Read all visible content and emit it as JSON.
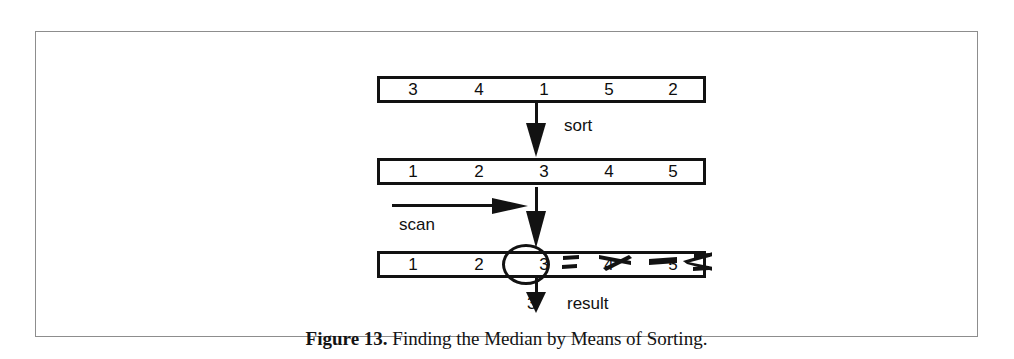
{
  "figure": {
    "caption_label": "Figure 13.",
    "caption_text": "Finding the Median by Means of Sorting."
  },
  "rows": {
    "unsorted": {
      "name": "unsorted-array",
      "values": [
        "3",
        "4",
        "1",
        "5",
        "2"
      ]
    },
    "sorted": {
      "name": "sorted-array",
      "values": [
        "1",
        "2",
        "3",
        "4",
        "5"
      ]
    },
    "scanned": {
      "name": "scanned-array",
      "values": [
        "1",
        "2",
        "3",
        "4",
        "5"
      ],
      "median_index": 2,
      "struck_out_indices": [
        3,
        4
      ]
    }
  },
  "labels": {
    "sort": "sort",
    "scan": "scan",
    "result": "result",
    "result_value": "3"
  },
  "colors": {
    "ink": "#121212",
    "frame": "#8d8d8d",
    "paper": "#ffffff"
  }
}
